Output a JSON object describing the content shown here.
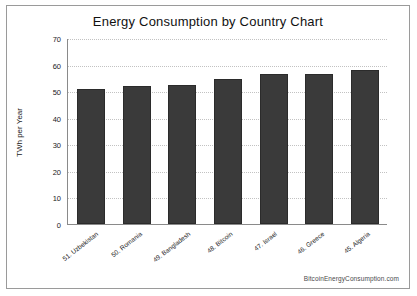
{
  "chart_data": {
    "type": "bar",
    "title": "Energy Consumption by Country Chart",
    "xlabel": "",
    "ylabel": "TWh per Year",
    "categories": [
      "51. Uzbekistan",
      "50. Romania",
      "49. Bangladesh",
      "48. Bitcoin",
      "47. Israel",
      "46. Greece",
      "45. Algeria"
    ],
    "values": [
      51,
      52,
      52.5,
      54.5,
      56.5,
      56.5,
      58
    ],
    "ylim": [
      0,
      70
    ],
    "yticks": [
      0,
      10,
      20,
      30,
      40,
      50,
      60,
      70
    ],
    "grid": true,
    "legend": "none",
    "bar_color": "#3a3a3a"
  },
  "watermark": "BitcoinEnergyConsumption.com"
}
